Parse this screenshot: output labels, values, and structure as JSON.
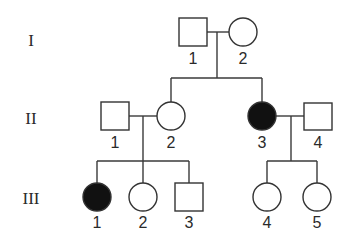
{
  "diagram": {
    "type": "pedigree",
    "colors": {
      "affected": "#111111",
      "unaffected": "#ffffff",
      "stroke": "#333333"
    },
    "generations": [
      {
        "label": "I",
        "y": 46
      },
      {
        "label": "II",
        "y": 124
      },
      {
        "label": "III",
        "y": 204
      }
    ],
    "individuals": [
      {
        "id": "I-1",
        "generation": "I",
        "number": "1",
        "sex": "male",
        "affected": false,
        "x": 193,
        "y": 32
      },
      {
        "id": "I-2",
        "generation": "I",
        "number": "2",
        "sex": "female",
        "affected": false,
        "x": 243,
        "y": 32
      },
      {
        "id": "II-1",
        "generation": "II",
        "number": "1",
        "sex": "male",
        "affected": false,
        "x": 115,
        "y": 116
      },
      {
        "id": "II-2",
        "generation": "II",
        "number": "2",
        "sex": "female",
        "affected": false,
        "x": 171,
        "y": 116
      },
      {
        "id": "II-3",
        "generation": "II",
        "number": "3",
        "sex": "female",
        "affected": true,
        "x": 262,
        "y": 116
      },
      {
        "id": "II-4",
        "generation": "II",
        "number": "4",
        "sex": "male",
        "affected": false,
        "x": 318,
        "y": 116
      },
      {
        "id": "III-1",
        "generation": "III",
        "number": "1",
        "sex": "female",
        "affected": true,
        "x": 97,
        "y": 197
      },
      {
        "id": "III-2",
        "generation": "III",
        "number": "2",
        "sex": "female",
        "affected": false,
        "x": 143,
        "y": 197
      },
      {
        "id": "III-3",
        "generation": "III",
        "number": "3",
        "sex": "male",
        "affected": false,
        "x": 189,
        "y": 197
      },
      {
        "id": "III-4",
        "generation": "III",
        "number": "4",
        "sex": "female",
        "affected": false,
        "x": 267,
        "y": 197
      },
      {
        "id": "III-5",
        "generation": "III",
        "number": "5",
        "sex": "female",
        "affected": false,
        "x": 317,
        "y": 197
      }
    ],
    "matings": [
      {
        "partners": [
          "I-1",
          "I-2"
        ],
        "children": [
          "II-2",
          "II-3"
        ]
      },
      {
        "partners": [
          "II-1",
          "II-2"
        ],
        "children": [
          "III-1",
          "III-2",
          "III-3"
        ]
      },
      {
        "partners": [
          "II-3",
          "II-4"
        ],
        "children": [
          "III-4",
          "III-5"
        ]
      }
    ]
  }
}
